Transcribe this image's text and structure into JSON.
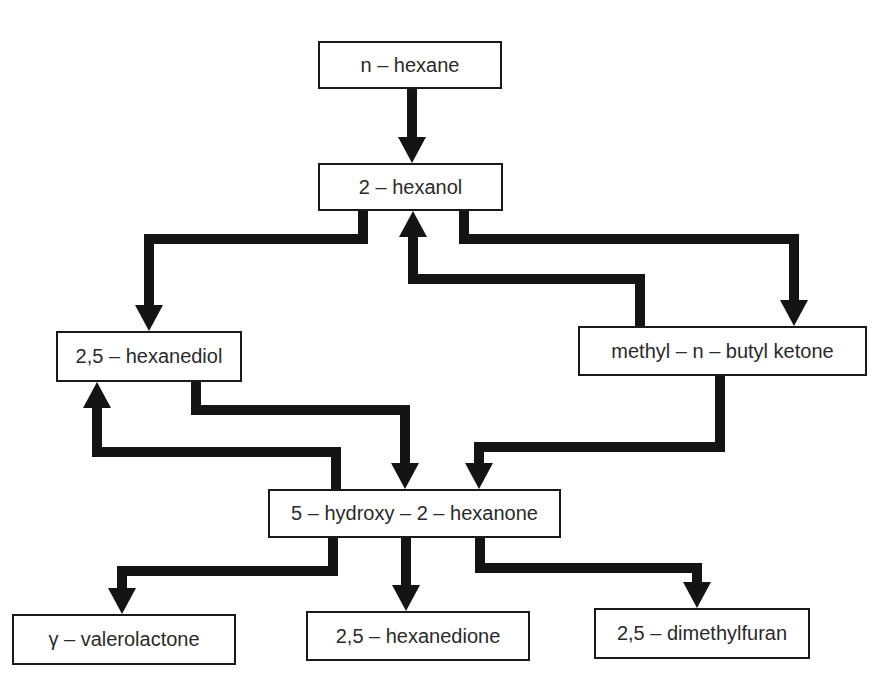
{
  "colors": {
    "arrow": "#141414",
    "border": "#1a1a1a",
    "text": "#2a2a2a",
    "background": "#ffffff"
  },
  "nodes": [
    {
      "id": "n-hexane",
      "label": "n – hexane",
      "x": 318,
      "y": 41,
      "w": 184,
      "h": 48
    },
    {
      "id": "2-hexanol",
      "label": "2 – hexanol",
      "x": 318,
      "y": 163,
      "w": 185,
      "h": 48
    },
    {
      "id": "2-5-hexanediol",
      "label": "2,5 – hexanediol",
      "x": 56,
      "y": 331,
      "w": 186,
      "h": 51
    },
    {
      "id": "methyl-n-butyl-ketone",
      "label": "methyl – n – butyl ketone",
      "x": 578,
      "y": 326,
      "w": 289,
      "h": 50
    },
    {
      "id": "5-hydroxy-2-hexanone",
      "label": "5 – hydroxy – 2 – hexanone",
      "x": 268,
      "y": 489,
      "w": 293,
      "h": 49
    },
    {
      "id": "gamma-valerolactone",
      "label": "γ – valerolactone",
      "x": 12,
      "y": 614,
      "w": 224,
      "h": 51
    },
    {
      "id": "2-5-hexanedione",
      "label": "2,5 – hexanedione",
      "x": 306,
      "y": 611,
      "w": 224,
      "h": 50
    },
    {
      "id": "2-5-dimethylfuran",
      "label": "2,5 – dimethylfuran",
      "x": 594,
      "y": 608,
      "w": 216,
      "h": 51
    }
  ],
  "arrows": [
    {
      "from": "n-hexane",
      "to": "2-hexanol",
      "points": [
        [
          412,
          89
        ],
        [
          412,
          163
        ]
      ]
    },
    {
      "from": "2-hexanol",
      "to": "2-5-hexanediol",
      "points": [
        [
          363,
          211
        ],
        [
          363,
          239
        ],
        [
          149,
          239
        ],
        [
          149,
          331
        ]
      ]
    },
    {
      "from": "2-hexanol",
      "to": "methyl-n-butyl-ketone",
      "points": [
        [
          464,
          211
        ],
        [
          464,
          239
        ],
        [
          794,
          239
        ],
        [
          794,
          326
        ]
      ]
    },
    {
      "from": "methyl-n-butyl-ketone",
      "to": "2-hexanol",
      "points": [
        [
          640,
          326
        ],
        [
          640,
          279
        ],
        [
          413,
          279
        ],
        [
          413,
          211
        ]
      ]
    },
    {
      "from": "2-5-hexanediol",
      "to": "5-hydroxy-2-hexanone",
      "points": [
        [
          196,
          382
        ],
        [
          196,
          410
        ],
        [
          405,
          410
        ],
        [
          405,
          489
        ]
      ]
    },
    {
      "from": "5-hydroxy-2-hexanone",
      "to": "2-5-hexanediol",
      "points": [
        [
          336,
          489
        ],
        [
          336,
          452
        ],
        [
          97,
          452
        ],
        [
          97,
          382
        ]
      ]
    },
    {
      "from": "methyl-n-butyl-ketone",
      "to": "5-hydroxy-2-hexanone",
      "points": [
        [
          720,
          376
        ],
        [
          720,
          447
        ],
        [
          479,
          447
        ],
        [
          479,
          489
        ]
      ]
    },
    {
      "from": "5-hydroxy-2-hexanone",
      "to": "gamma-valerolactone",
      "points": [
        [
          333,
          538
        ],
        [
          333,
          571
        ],
        [
          122,
          571
        ],
        [
          122,
          614
        ]
      ]
    },
    {
      "from": "5-hydroxy-2-hexanone",
      "to": "2-5-hexanedione",
      "points": [
        [
          406,
          538
        ],
        [
          406,
          611
        ]
      ]
    },
    {
      "from": "5-hydroxy-2-hexanone",
      "to": "2-5-dimethylfuran",
      "points": [
        [
          480,
          538
        ],
        [
          480,
          568
        ],
        [
          697,
          568
        ],
        [
          697,
          608
        ]
      ]
    }
  ]
}
